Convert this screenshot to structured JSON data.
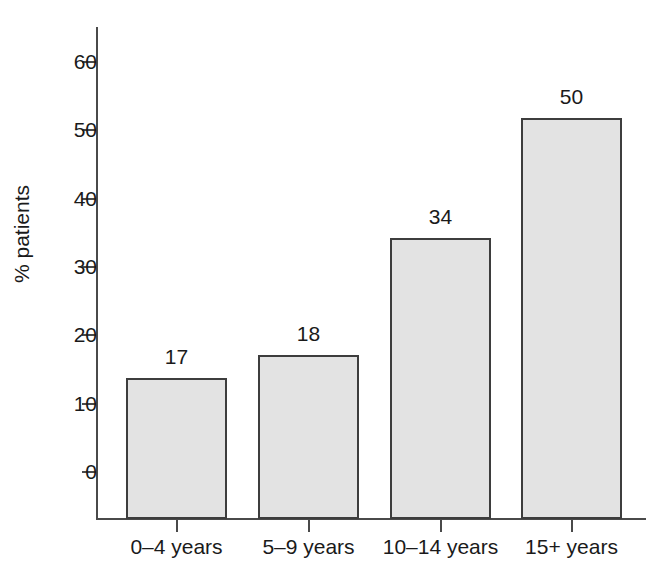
{
  "chart_data": {
    "type": "bar",
    "title": "",
    "subtitle": "",
    "xlabel": "",
    "ylabel": "% patients",
    "categories": [
      "0–4 years",
      "5–9 years",
      "10–14 years",
      "15+ years"
    ],
    "values": [
      17,
      18,
      34,
      50
    ],
    "bar_labels": [
      "17",
      "18",
      "34",
      "50"
    ],
    "ylim": [
      0,
      65
    ],
    "yticks": [
      0,
      10,
      20,
      30,
      40,
      50,
      60
    ],
    "ytick_labels": [
      "0",
      "10",
      "20",
      "30",
      "40",
      "50",
      "60"
    ],
    "grid": false,
    "legend": null,
    "legend_position": "none",
    "colors": {
      "bar_fill": "#e3e3e3",
      "bar_border": "#3d3d3d",
      "axis": "#4a4a4a",
      "text": "#1a1a1a",
      "background": "#ffffff"
    },
    "bar_pixel_tops": [
      378,
      355,
      238,
      118
    ],
    "annotations": []
  }
}
